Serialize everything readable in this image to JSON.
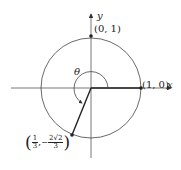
{
  "diagram": {
    "type": "unit-circle",
    "axes": {
      "x_label": "x",
      "y_label": "y"
    },
    "angle_label": "θ",
    "points": [
      {
        "id": "top",
        "label": "(0, 1)"
      },
      {
        "id": "right",
        "label": "(1, 0)"
      },
      {
        "id": "terminal",
        "label_x_num": "1",
        "label_x_den": "3",
        "label_y_sign": "−",
        "label_y_num": "2√2",
        "label_y_den": "3",
        "separator": ","
      }
    ],
    "colors": {
      "stroke": "#333333",
      "background": "#ffffff"
    }
  }
}
